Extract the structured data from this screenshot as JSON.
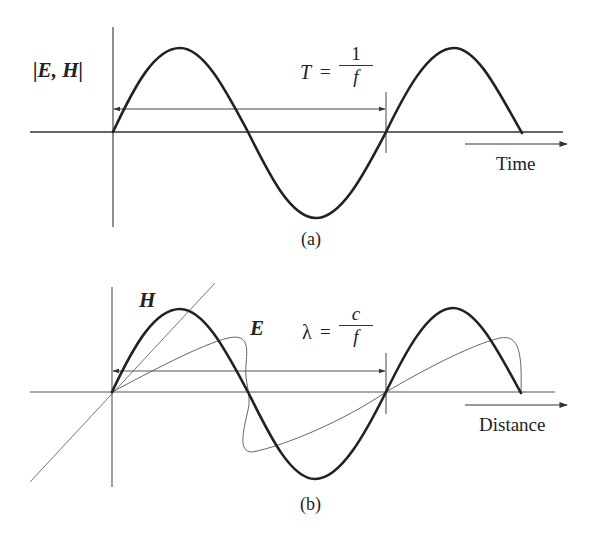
{
  "panel_a": {
    "caption": "(a)",
    "y_label": "|E, H|",
    "period_label": {
      "lhs": "T",
      "eq": "=",
      "numerator": "1",
      "denominator": "f"
    },
    "axis_label": "Time",
    "waves": [
      {
        "name": "E,H amplitude",
        "style": "thick",
        "cycles": 1.5
      }
    ]
  },
  "panel_b": {
    "caption": "(b)",
    "wave_labels": {
      "h": "H",
      "e": "E"
    },
    "wavelength_label": {
      "lhs": "λ",
      "eq": "=",
      "numerator": "c",
      "denominator": "f"
    },
    "axis_label": "Distance",
    "waves": [
      {
        "name": "H",
        "style": "thick",
        "cycles": 1.5
      },
      {
        "name": "E",
        "style": "thin-perspective",
        "cycles": 1.5
      }
    ]
  },
  "colors": {
    "stroke": "#222222",
    "thin_stroke": "#666666",
    "background": "#ffffff"
  }
}
